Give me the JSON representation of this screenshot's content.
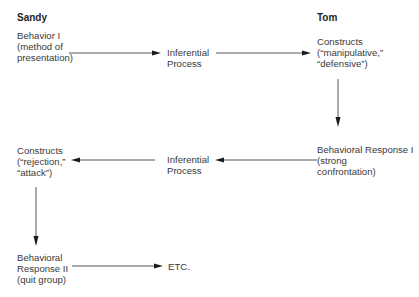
{
  "diagram": {
    "people": {
      "left": "Sandy",
      "right": "Tom"
    },
    "nodes": {
      "behavior_1": [
        "Behavior I",
        "(method of",
        "presentation)"
      ],
      "inferential_1": [
        "Inferential",
        "Process"
      ],
      "constructs_tom": [
        "Constructs",
        "(“manipulative,”",
        "“defensive”)"
      ],
      "behavioral_response_1": [
        "Behavioral Response I",
        "(strong",
        "confrontation)"
      ],
      "inferential_2": [
        "Inferential",
        "Process"
      ],
      "constructs_sandy": [
        "Constructs",
        "(“rejection,”",
        "“attack”)"
      ],
      "behavioral_response_2": [
        "Behavioral",
        "Response II",
        "(quit group)"
      ],
      "etc": [
        "ETC."
      ]
    },
    "edges": [
      {
        "from": "behavior_1",
        "to": "inferential_1",
        "direction": "right"
      },
      {
        "from": "inferential_1",
        "to": "constructs_tom",
        "direction": "right"
      },
      {
        "from": "constructs_tom",
        "to": "behavioral_response_1",
        "direction": "down"
      },
      {
        "from": "behavioral_response_1",
        "to": "inferential_2",
        "direction": "left"
      },
      {
        "from": "inferential_2",
        "to": "constructs_sandy",
        "direction": "left"
      },
      {
        "from": "constructs_sandy",
        "to": "behavioral_response_2",
        "direction": "down"
      },
      {
        "from": "behavioral_response_2",
        "to": "etc",
        "direction": "right"
      }
    ]
  }
}
